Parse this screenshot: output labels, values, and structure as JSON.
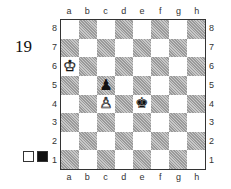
{
  "diagram": {
    "number": "19",
    "files": [
      "a",
      "b",
      "c",
      "d",
      "e",
      "f",
      "g",
      "h"
    ],
    "ranks": [
      "8",
      "7",
      "6",
      "5",
      "4",
      "3",
      "2",
      "1"
    ],
    "pieces": [
      {
        "square": "a6",
        "piece": "white-king",
        "glyph": "♔",
        "color": "w"
      },
      {
        "square": "c5",
        "piece": "black-pawn",
        "glyph": "♟",
        "color": "b"
      },
      {
        "square": "c4",
        "piece": "white-pawn",
        "glyph": "♙",
        "color": "w"
      },
      {
        "square": "e4",
        "piece": "black-king",
        "glyph": "♚",
        "color": "b"
      }
    ],
    "side_to_move_indicator": {
      "white_box": "#ffffff",
      "black_box": "#111111"
    }
  }
}
